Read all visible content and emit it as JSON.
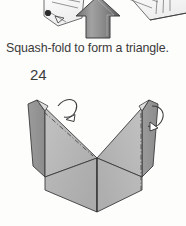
{
  "page": {
    "background_color": "#fdfdfc",
    "step_number": "24",
    "caption": "Squash-fold to form a triangle."
  },
  "figures": {
    "top": {
      "name": "previous-step-illustration",
      "description": "Cropped bottom edge of the previous origami step diagram with a large upward pointing action arrow",
      "arrow": {
        "name": "large-up-arrow",
        "direction": "up",
        "fill_color": "#8a8a8a",
        "stroke_color": "#4a4a4a"
      },
      "line_art_color": "#555555"
    },
    "main": {
      "name": "step-24-illustration",
      "description": "V-shaped squash-folded origami model shown in three-quarter view with two valley fold lines and two curved fold arrows",
      "paper": {
        "light_face_color": "#c9c9c9",
        "mid_face_color": "#b4b4b4",
        "shadow_face_color": "#9d9d9d",
        "dark_edge_color": "#8f8f8f",
        "outline_color": "#3c3c3c",
        "fold_line_color": "#4a4a4a",
        "fold_line_style": "dash-dot"
      },
      "arrows": [
        {
          "name": "fold-arrow-left",
          "description": "curved arrow over the left flap indicating the fold direction",
          "stroke_color": "#3c3c3c",
          "fill_color": "#ffffff"
        },
        {
          "name": "fold-arrow-right",
          "description": "curved arrow over the right flap indicating the fold direction",
          "stroke_color": "#3c3c3c",
          "fill_color": "#ffffff"
        }
      ]
    }
  }
}
